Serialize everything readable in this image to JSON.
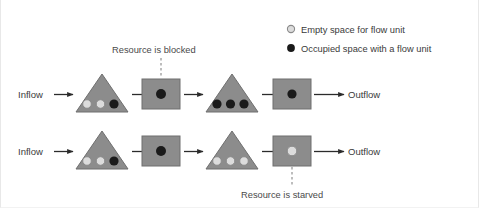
{
  "figure": {
    "title_none": "",
    "border_color": "#e8e8e8",
    "dotted_rule_color": "#5a5a66"
  },
  "legend": {
    "items": [
      {
        "marker": "empty-circle-icon",
        "label": "Empty space for flow unit",
        "fill": "#dcdcdc",
        "stroke": "#8a8a8a"
      },
      {
        "marker": "filled-circle-icon",
        "label": "Occupied space with a flow unit",
        "fill": "#1a1a1a",
        "stroke": "#1a1a1a"
      }
    ]
  },
  "annotations": {
    "blocked": "Resource is blocked",
    "starved": "Resource is starved"
  },
  "colors": {
    "buffer_triangle": "#8c8c8c",
    "resource_rect": "#8c8c8c",
    "shape_stroke": "#6f6f6f",
    "occupied": "#1a1a1a",
    "empty": "#dcdcdc",
    "empty_stroke": "#8a8a8a",
    "arrow": "#2b2b2b",
    "dashed_leader": "#9a9a9a",
    "text": "#3a3a3a"
  },
  "rows": [
    {
      "id": "row-blocked",
      "inflow_label": "Inflow",
      "outflow_label": "Outflow",
      "stages": [
        {
          "type": "buffer",
          "name": "buffer-1",
          "slots": [
            "empty",
            "empty",
            "occupied"
          ]
        },
        {
          "type": "resource",
          "name": "resource-1",
          "slots": [
            "occupied"
          ]
        },
        {
          "type": "buffer",
          "name": "buffer-2",
          "slots": [
            "occupied",
            "occupied",
            "occupied"
          ]
        },
        {
          "type": "resource",
          "name": "resource-2",
          "slots": [
            "occupied"
          ]
        }
      ],
      "callout": {
        "text": "Resource is blocked",
        "target": "resource-1",
        "position": "above"
      }
    },
    {
      "id": "row-starved",
      "inflow_label": "Inflow",
      "outflow_label": "Outflow",
      "stages": [
        {
          "type": "buffer",
          "name": "buffer-3",
          "slots": [
            "empty",
            "empty",
            "occupied"
          ]
        },
        {
          "type": "resource",
          "name": "resource-3",
          "slots": [
            "occupied"
          ]
        },
        {
          "type": "buffer",
          "name": "buffer-4",
          "slots": [
            "empty",
            "empty",
            "empty"
          ]
        },
        {
          "type": "resource",
          "name": "resource-4",
          "slots": [
            "empty"
          ]
        }
      ],
      "callout": {
        "text": "Resource is starved",
        "target": "resource-4",
        "position": "below"
      }
    }
  ]
}
